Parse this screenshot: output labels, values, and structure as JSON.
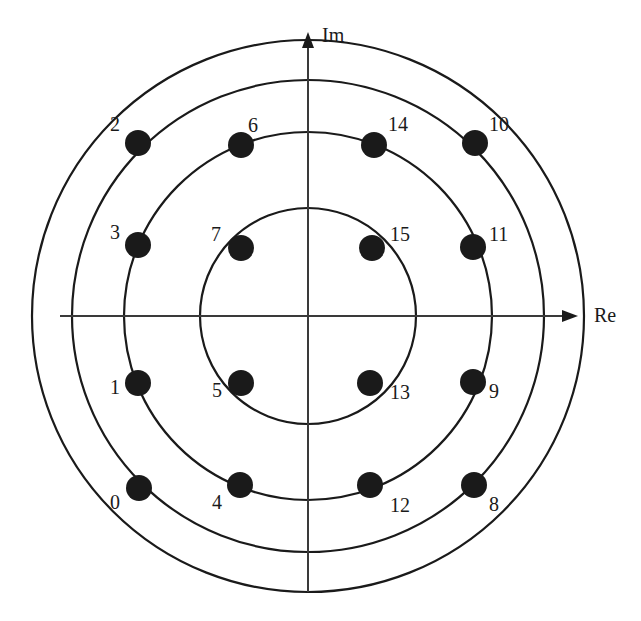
{
  "figure": {
    "type": "constellation-diagram",
    "background_color": "#ffffff",
    "ink_color": "#1a1a1a",
    "point_color": "#1a1a1a"
  },
  "axes": {
    "real": {
      "label": "Re",
      "arrow": "right",
      "label_x": 594,
      "label_y": 305
    },
    "imag": {
      "label": "Im",
      "arrow": "up",
      "label_x": 322,
      "label_y": 25
    },
    "origin": {
      "x": 308,
      "y": 316
    },
    "x_range": [
      60,
      578
    ],
    "y_range": [
      32,
      592
    ]
  },
  "chart_data": {
    "type": "scatter",
    "title": "",
    "xlabel": "Re",
    "ylabel": "Im",
    "grid": false,
    "legend": false,
    "center": {
      "x": 308,
      "y": 316
    },
    "rings": [
      {
        "name": "inner",
        "radius_px": 108
      },
      {
        "name": "middle-inner",
        "radius_px": 184
      },
      {
        "name": "middle-outer",
        "radius_px": 236
      },
      {
        "name": "outer",
        "radius_px": 276
      }
    ],
    "points": [
      {
        "label": "0",
        "x": 139,
        "y": 488,
        "ring": "middle-outer",
        "lx": 110,
        "ly": 492
      },
      {
        "label": "1",
        "x": 138,
        "y": 383,
        "ring": "middle-outer",
        "lx": 110,
        "ly": 377
      },
      {
        "label": "2",
        "x": 138,
        "y": 143,
        "ring": "middle-outer",
        "lx": 110,
        "ly": 114
      },
      {
        "label": "3",
        "x": 138,
        "y": 245,
        "ring": "middle-outer",
        "lx": 110,
        "ly": 222
      },
      {
        "label": "4",
        "x": 240,
        "y": 485,
        "ring": "middle-inner",
        "lx": 212,
        "ly": 492
      },
      {
        "label": "5",
        "x": 241,
        "y": 383,
        "ring": "middle-inner",
        "lx": 212,
        "ly": 380
      },
      {
        "label": "6",
        "x": 241,
        "y": 145,
        "ring": "middle-inner",
        "lx": 248,
        "ly": 115
      },
      {
        "label": "7",
        "x": 241,
        "y": 248,
        "ring": "middle-inner",
        "lx": 211,
        "ly": 224
      },
      {
        "label": "8",
        "x": 474,
        "y": 485,
        "ring": "middle-outer",
        "lx": 489,
        "ly": 494
      },
      {
        "label": "9",
        "x": 473,
        "y": 382,
        "ring": "middle-outer",
        "lx": 489,
        "ly": 381
      },
      {
        "label": "10",
        "x": 475,
        "y": 143,
        "ring": "middle-outer",
        "lx": 489,
        "ly": 114
      },
      {
        "label": "11",
        "x": 473,
        "y": 247,
        "ring": "middle-outer",
        "lx": 489,
        "ly": 224
      },
      {
        "label": "12",
        "x": 370,
        "y": 485,
        "ring": "middle-inner",
        "lx": 390,
        "ly": 495
      },
      {
        "label": "13",
        "x": 370,
        "y": 383,
        "ring": "middle-inner",
        "lx": 390,
        "ly": 382
      },
      {
        "label": "14",
        "x": 374,
        "y": 145,
        "ring": "middle-inner",
        "lx": 388,
        "ly": 114
      },
      {
        "label": "15",
        "x": 372,
        "y": 248,
        "ring": "middle-inner",
        "lx": 390,
        "ly": 224
      }
    ],
    "point_radius_px": 13
  }
}
